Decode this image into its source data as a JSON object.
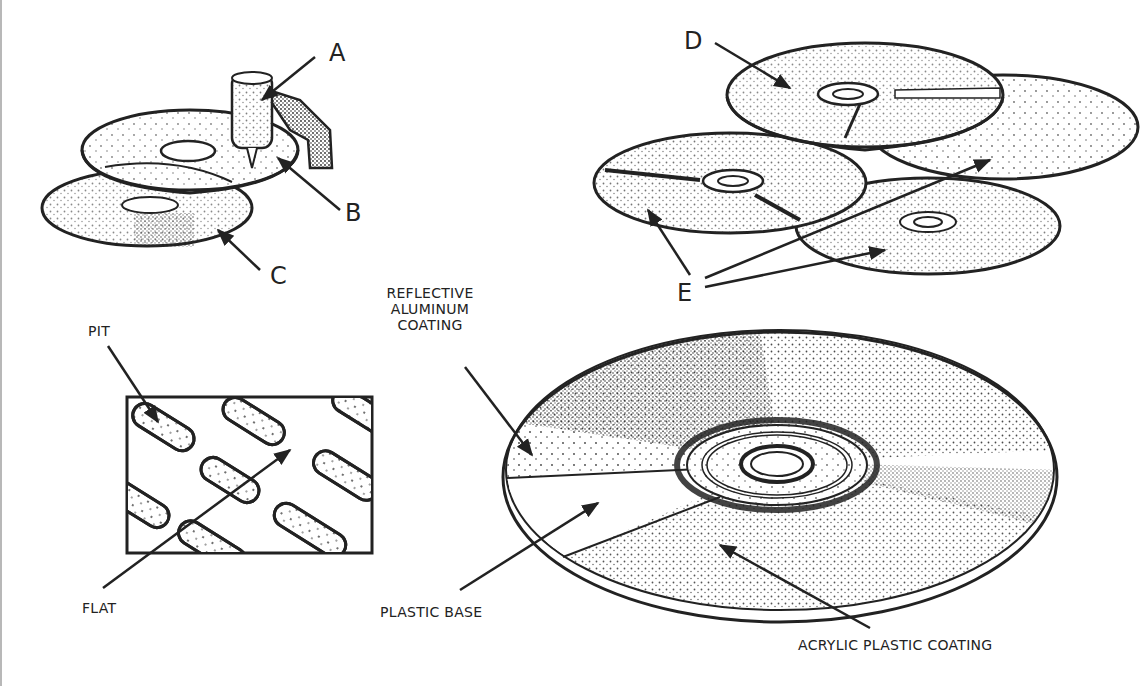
{
  "diagram": {
    "colors": {
      "ink": "#222222",
      "background": "#ffffff",
      "stipple": "#2a2a2a"
    },
    "labels": {
      "a": "A",
      "b": "B",
      "c": "C",
      "d": "D",
      "e": "E",
      "reflective_line1": "REFLECTIVE",
      "reflective_line2": "ALUMINUM",
      "reflective_line3": "COATING",
      "pit": "PIT",
      "flat": "FLAT",
      "plastic_base": "PLASTIC BASE",
      "acrylic": "ACRYLIC PLASTIC COATING"
    },
    "panels": [
      {
        "id": "mastering",
        "depicts": "stylus cutting a master disc above a second disc",
        "labels": [
          "A",
          "B",
          "C"
        ]
      },
      {
        "id": "stacked-discs",
        "depicts": "four stacked compact discs",
        "labels": [
          "D",
          "E"
        ]
      },
      {
        "id": "pit-detail",
        "depicts": "close-up rectangle of pits and flats on disc surface",
        "labels": [
          "PIT",
          "FLAT"
        ]
      },
      {
        "id": "cd-layers",
        "depicts": "compact disc cutaway showing layers",
        "labels": [
          "REFLECTIVE ALUMINUM COATING",
          "PLASTIC BASE",
          "ACRYLIC PLASTIC COATING"
        ]
      }
    ]
  }
}
